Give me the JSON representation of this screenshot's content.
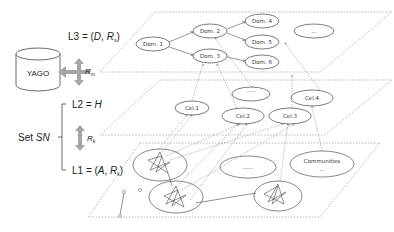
{
  "layers": {
    "l3": {
      "label": "L3 = (",
      "var": "D",
      "sep": ", ",
      "rel": "R",
      "sub": "s",
      "close": ")"
    },
    "l2": {
      "label": "L2 = ",
      "var": "H"
    },
    "l1": {
      "label": "L1 = (",
      "var": "A",
      "sep": ", ",
      "rel": "R",
      "sub": "k",
      "close": ")"
    }
  },
  "yago": {
    "label": "YAGO"
  },
  "arrows": {
    "rm": {
      "label": "R",
      "sub": "m"
    },
    "rk": {
      "label": "R",
      "sub": "k"
    }
  },
  "set_sn": {
    "prefix": "Set ",
    "var": "SN"
  },
  "domains": [
    {
      "label": "Dom. 1"
    },
    {
      "label": "Dom. 2"
    },
    {
      "label": "Dom. 3"
    },
    {
      "label": "Dom. 4"
    },
    {
      "label": "Dom. 5"
    },
    {
      "label": "Dom. 6"
    },
    {
      "label": "..."
    }
  ],
  "celebrities": [
    {
      "label": "Cel.1"
    },
    {
      "label": "Cel.2"
    },
    {
      "label": "Cel.3"
    },
    {
      "label": "Cel.4"
    },
    {
      "label": "....."
    }
  ],
  "communities": {
    "label": "Communities",
    "ellipsis": "...",
    "blank": "......"
  },
  "colors": {
    "line": "#555555",
    "dashed": "#888888",
    "arrow_fill": "#a6a6a6"
  }
}
